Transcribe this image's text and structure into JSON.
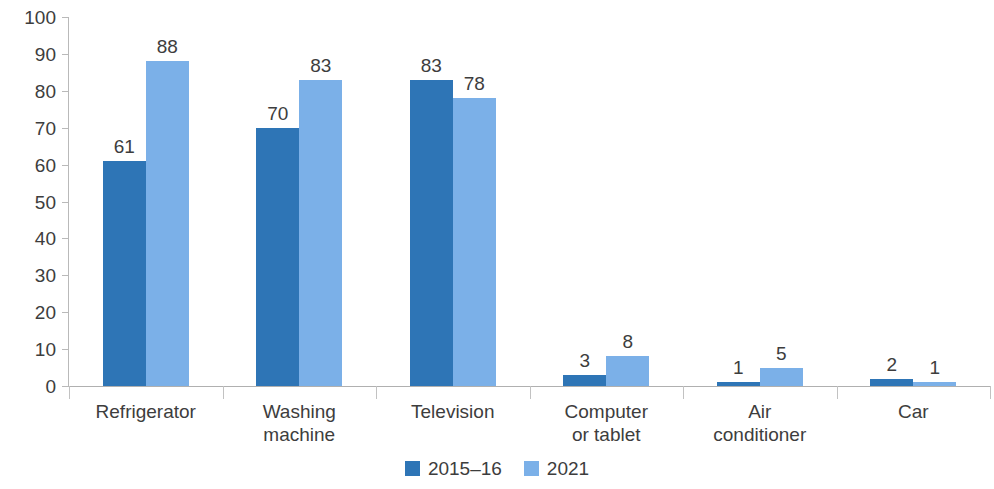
{
  "chart_data": {
    "type": "bar",
    "title": "",
    "subtitle": "",
    "xlabel": "",
    "ylabel": "",
    "ylim": [
      0,
      100
    ],
    "ytick_step": 10,
    "ytick_labels": [
      "100",
      "90",
      "80",
      "70",
      "60",
      "50",
      "40",
      "30",
      "20",
      "10",
      "0"
    ],
    "grid": false,
    "legend_position": "bottom",
    "categories": [
      "Refrigerator",
      "Washing machine",
      "Television",
      "Computer or tablet",
      "Air conditioner",
      "Car"
    ],
    "category_lines": [
      [
        "Refrigerator"
      ],
      [
        "Washing",
        "machine"
      ],
      [
        "Television"
      ],
      [
        "Computer",
        "or tablet"
      ],
      [
        "Air",
        "conditioner"
      ],
      [
        "Car"
      ]
    ],
    "series": [
      {
        "name": "2015–16",
        "color": "#2E75B6",
        "values": [
          61,
          70,
          83,
          3,
          1,
          2
        ],
        "labels": [
          "61",
          "70",
          "83",
          "3",
          "1",
          "2"
        ]
      },
      {
        "name": "2021",
        "color": "#7BB0E8",
        "values": [
          88,
          83,
          78,
          8,
          5,
          1
        ],
        "labels": [
          "88",
          "83",
          "78",
          "8",
          "5",
          "1"
        ]
      }
    ]
  },
  "axis": {
    "line_color": "#b9b9b9",
    "baseline_color": "#b0b0b0",
    "tick_color": "#c2c2c2"
  },
  "legend": {
    "items": [
      {
        "label": "2015–16",
        "color": "#2E75B6"
      },
      {
        "label": "2021",
        "color": "#7BB0E8"
      }
    ]
  }
}
